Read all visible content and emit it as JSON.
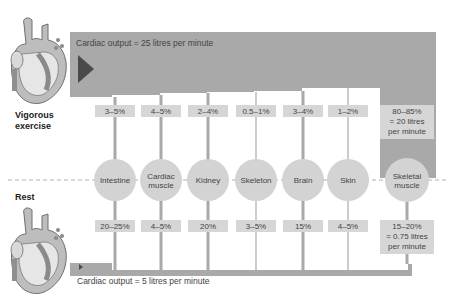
{
  "diagram": {
    "exercise": {
      "label_line1": "Vigorous",
      "label_line2": "exercise",
      "cardiac_output": "Cardiac output = 25 litres per minute"
    },
    "rest": {
      "label": "Rest",
      "cardiac_output": "Cardiac output = 5 litres per minute"
    },
    "organs": [
      {
        "name": [
          "Intestine"
        ],
        "exercise": [
          "3–5%"
        ],
        "rest": [
          "20–25%"
        ]
      },
      {
        "name": [
          "Cardiac",
          "muscle"
        ],
        "exercise": [
          "4–5%"
        ],
        "rest": [
          "4–5%"
        ]
      },
      {
        "name": [
          "Kidney"
        ],
        "exercise": [
          "2–4%"
        ],
        "rest": [
          "20%"
        ]
      },
      {
        "name": [
          "Skeleton"
        ],
        "exercise": [
          "0.5–1%"
        ],
        "rest": [
          "3–5%"
        ]
      },
      {
        "name": [
          "Brain"
        ],
        "exercise": [
          "3–4%"
        ],
        "rest": [
          "15%"
        ]
      },
      {
        "name": [
          "Skin"
        ],
        "exercise": [
          "1–2%"
        ],
        "rest": [
          "4–5%"
        ]
      },
      {
        "name": [
          "Skeletal",
          "muscle"
        ],
        "exercise": [
          "80–85%",
          "= 20 litres",
          "per minute"
        ],
        "rest": [
          "15–20%",
          "= 0.75 litres",
          "per minute"
        ]
      }
    ],
    "colors": {
      "flow_band": "#a9a9a9",
      "arrow": "#4a4a4a",
      "organ_circle": "#d3d3d3",
      "value_box": "#d6d6d6",
      "heart_fill": "#bdbdbd",
      "heart_dark": "#8a8a8a"
    }
  }
}
